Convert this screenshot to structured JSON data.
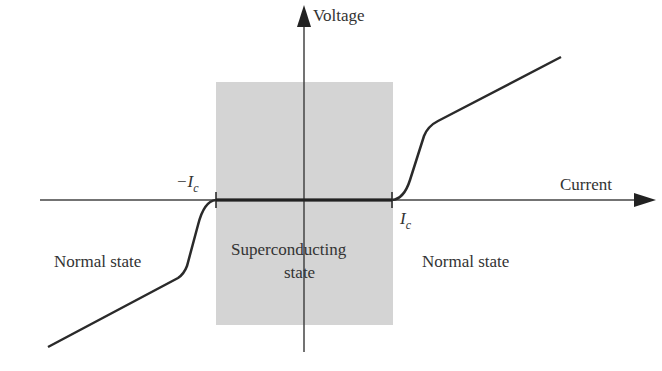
{
  "diagram": {
    "axes": {
      "y_label": "Voltage",
      "x_label": "Current"
    },
    "markers": {
      "neg_critical": {
        "sign": "−",
        "symbol": "I",
        "subscript": "c"
      },
      "pos_critical": {
        "symbol": "I",
        "subscript": "c"
      }
    },
    "regions": {
      "left": "Normal state",
      "center_line1": "Superconducting",
      "center_line2": "state",
      "right": "Normal state"
    },
    "colors": {
      "region_fill": "#d4d4d4",
      "line": "#2a2a2a",
      "text": "#333333"
    }
  }
}
